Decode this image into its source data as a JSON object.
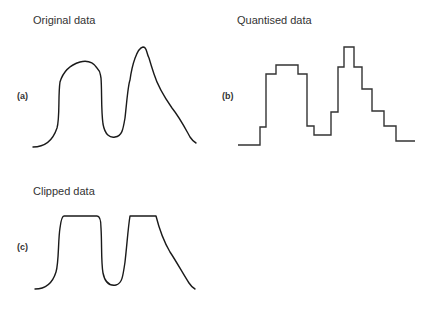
{
  "panels": [
    {
      "id": "a",
      "title": "Original data",
      "tag": "(a)",
      "kind": "smooth signal"
    },
    {
      "id": "b",
      "title": "Quantised data",
      "tag": "(b)",
      "kind": "step signal"
    },
    {
      "id": "c",
      "title": "Clipped data",
      "tag": "(c)",
      "kind": "clipped signal"
    }
  ],
  "colors": {
    "line": "#1a1a1a",
    "step_line": "#333333",
    "text": "#333333",
    "background": "#ffffff"
  }
}
